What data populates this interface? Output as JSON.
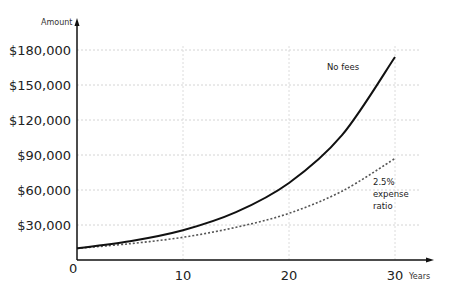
{
  "chart_data": {
    "type": "line",
    "title": "",
    "xlabel": "Years",
    "ylabel": "Amount",
    "xlim": [
      0,
      30
    ],
    "ylim": [
      0,
      180000
    ],
    "x_ticks": [
      0,
      10,
      20,
      30
    ],
    "x_tick_labels": [
      "0",
      "10",
      "20",
      "30"
    ],
    "y_ticks": [
      30000,
      60000,
      90000,
      120000,
      150000,
      180000
    ],
    "y_tick_labels": [
      "$30,000",
      "$60,000",
      "$90,000",
      "$120,000",
      "$150,000",
      "$180,000"
    ],
    "grid": true,
    "legend": "inline annotations",
    "x": [
      0,
      5,
      10,
      15,
      20,
      25,
      30
    ],
    "series": [
      {
        "name": "No fees",
        "style": "solid",
        "values": [
          10000,
          16000,
          25500,
          41000,
          66000,
          107000,
          174000
        ]
      },
      {
        "name": "2.5% expense ratio",
        "style": "dotted",
        "values": [
          10000,
          14000,
          19500,
          28000,
          40000,
          59000,
          87000
        ]
      }
    ],
    "annotations": [
      {
        "text": "No fees",
        "series": "No fees"
      },
      {
        "text": "2.5%\nexpense\nratio",
        "series": "2.5% expense ratio"
      }
    ]
  },
  "labels": {
    "y_axis": "Amount",
    "x_axis": "Years",
    "origin": "0",
    "no_fees": "No fees",
    "fee_line1": "2.5%",
    "fee_line2": "expense",
    "fee_line3": "ratio"
  }
}
